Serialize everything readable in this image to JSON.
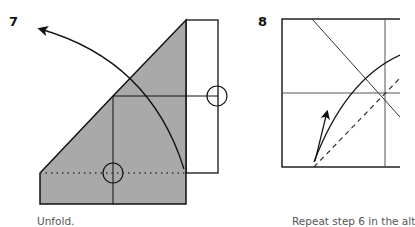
{
  "steps": [
    {
      "number": "7",
      "caption": "Unfold.",
      "colors": {
        "paper_fill": "#a9a9a9",
        "line": "#111111"
      },
      "marks": [
        "curved-unfold-arrow",
        "reference-circle-right",
        "reference-circle-bottom",
        "dotted-fold-line"
      ]
    },
    {
      "number": "8",
      "caption": "Repeat step 6 in the alt",
      "colors": {
        "paper_fill": "#ffffff",
        "line": "#111111"
      },
      "marks": [
        "diagonal-crease",
        "vertical-crease",
        "horizontal-crease",
        "curved-fold-line",
        "dashed-valley-fold",
        "fold-arrow"
      ]
    }
  ]
}
